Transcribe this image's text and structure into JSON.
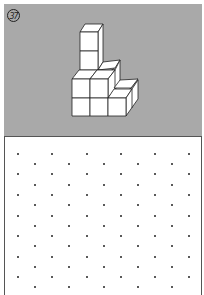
{
  "figure": {
    "number_label": "37",
    "panel_color": "#a9a9a9",
    "cube_fill": "#ffffff",
    "cube_stroke": "#222222"
  },
  "dot_grid": {
    "dot_color": "#222222",
    "columns_even_x": [
      18,
      52,
      87,
      121,
      155,
      189
    ],
    "columns_odd_x": [
      35,
      69,
      104,
      138,
      172
    ],
    "rows_even_y": [
      154,
      174,
      195,
      216,
      236,
      257,
      277
    ],
    "rows_odd_y": [
      164,
      185,
      205,
      226,
      246,
      267,
      287
    ]
  }
}
